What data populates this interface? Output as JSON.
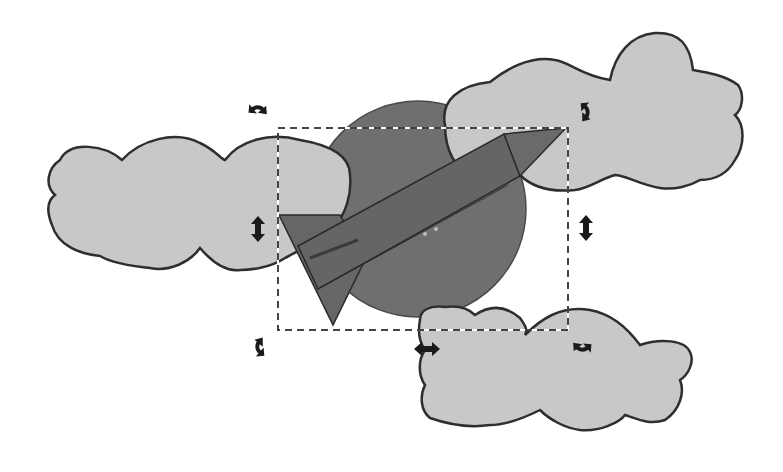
{
  "canvas": {
    "width": 783,
    "height": 472,
    "background": "#ffffff",
    "mode": "rotate",
    "colors": {
      "cloud_fill": "#c8c8c8",
      "cloud_stroke": "#2e2e2e",
      "planet_fill": "#6f6f6f",
      "rocket_fill": "#666666",
      "rocket_stroke": "#2a2a2a",
      "handle_fill": "#1a1a1a",
      "selection_dash_dark": "#444444",
      "selection_dash_light": "#ffffff"
    }
  },
  "objects": [
    {
      "name": "cloud-left"
    },
    {
      "name": "cloud-top-right"
    },
    {
      "name": "cloud-bottom-right"
    },
    {
      "name": "planet-circle"
    },
    {
      "name": "rocket"
    }
  ],
  "selection": {
    "bbox": {
      "x": 278,
      "y": 128,
      "width": 290,
      "height": 202
    },
    "handles": [
      {
        "name": "rotate-handle-top-left",
        "type": "rotate"
      },
      {
        "name": "rotate-handle-top-right",
        "type": "rotate"
      },
      {
        "name": "rotate-handle-bottom-left",
        "type": "rotate"
      },
      {
        "name": "rotate-handle-bottom-right",
        "type": "rotate"
      },
      {
        "name": "skew-handle-left",
        "type": "skew-vertical"
      },
      {
        "name": "skew-handle-right",
        "type": "skew-vertical"
      },
      {
        "name": "skew-handle-bottom",
        "type": "skew-horizontal"
      }
    ]
  }
}
